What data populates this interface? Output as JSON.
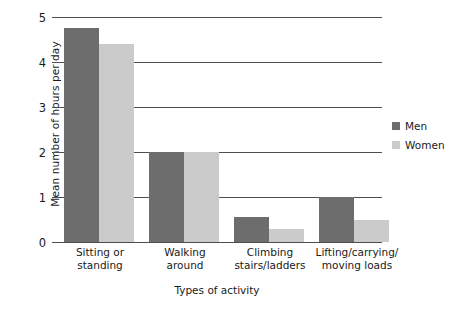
{
  "chart_data": {
    "type": "bar",
    "title": "",
    "xlabel": "Types of activity",
    "ylabel": "Mean number of hours per day",
    "categories": [
      "Sitting or\nstanding",
      "Walking\naround",
      "Climbing\nstairs/ladders",
      "Lifting/carrying/\nmoving loads"
    ],
    "series": [
      {
        "name": "Men",
        "color": "#6d6d6d",
        "values": [
          4.75,
          2.0,
          0.55,
          1.0
        ]
      },
      {
        "name": "Women",
        "color": "#cbcbcb",
        "values": [
          4.4,
          2.0,
          0.3,
          0.5
        ]
      }
    ],
    "ylim": [
      0,
      5
    ],
    "yticks": [
      "0",
      "1",
      "2",
      "3",
      "4",
      "5"
    ],
    "grid": "horizontal",
    "legend_position": "right"
  },
  "axis": {
    "y_title": "Mean number of hours per day",
    "x_title": "Types of activity",
    "y_tick_0": "0",
    "y_tick_1": "1",
    "y_tick_2": "2",
    "y_tick_3": "3",
    "y_tick_4": "4",
    "y_tick_5": "5"
  },
  "categories_display": [
    {
      "line1": "Sitting or",
      "line2": "standing"
    },
    {
      "line1": "Walking",
      "line2": "around"
    },
    {
      "line1": "Climbing",
      "line2": "stairs/ladders"
    },
    {
      "line1": "Lifting/carrying/",
      "line2": "moving loads"
    }
  ],
  "legend": {
    "items": [
      {
        "label": "Men",
        "color": "#6d6d6d"
      },
      {
        "label": "Women",
        "color": "#cbcbcb"
      }
    ]
  }
}
